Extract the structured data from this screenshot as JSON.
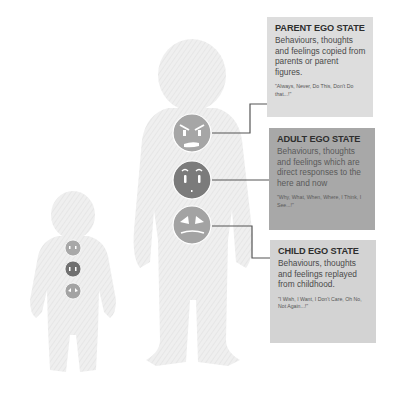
{
  "diagram": {
    "type": "transactional-analysis-ego-states",
    "figures": [
      {
        "name": "adult-figure",
        "role": "large silhouette"
      },
      {
        "name": "child-figure",
        "role": "small silhouette"
      }
    ],
    "colors": {
      "silhouette": "#ececec",
      "parent_face": "#a6a6a6",
      "adult_face": "#7b7b7b",
      "child_face": "#a3a3a3",
      "connector": "#555555",
      "parent_box": "#dddddd",
      "adult_box": "#a8a8a8",
      "child_box": "#d3d3d3"
    }
  },
  "states": {
    "parent": {
      "title": "PARENT EGO STATE",
      "description": "Behaviours, thoughts and feelings copied from parents or parent figures.",
      "quote": "\"Always, Never, Do This, Don't Do that...!\"",
      "face": "angry-face"
    },
    "adult": {
      "title": "ADULT EGO STATE",
      "description": "Behaviours, thoughts and feelings  which are direct responses to the here and now",
      "quote": "\"Why, What, When, Where, I Think, I See...!\"",
      "face": "neutral-face"
    },
    "child": {
      "title": "CHILD EGO STATE",
      "description": "Behaviours, thoughts and feelings replayed from childhood.",
      "quote": "\"I Wish, I Want, I Don't Care, Oh No, Not Again...!\"",
      "face": "upset-face"
    }
  }
}
